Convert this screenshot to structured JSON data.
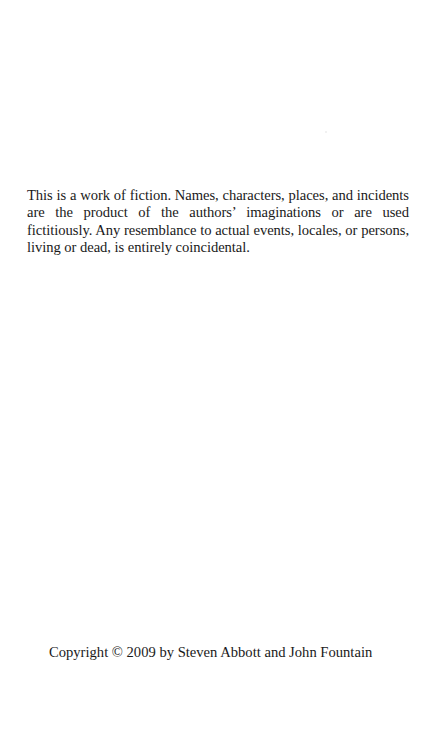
{
  "page": {
    "type": "copyright-page",
    "disclaimer": "This is a work of fiction. Names, characters, places, and incidents are the product of the authors’ imaginations or are used fictitiously. Any resemblance to actual events, locales, or persons, living or dead, is entirely coincidental.",
    "copyright": "Copyright © 2009 by Steven Abbott and John Fountain"
  },
  "colors": {
    "background": "#ffffff",
    "text": "#1a1a1a"
  }
}
